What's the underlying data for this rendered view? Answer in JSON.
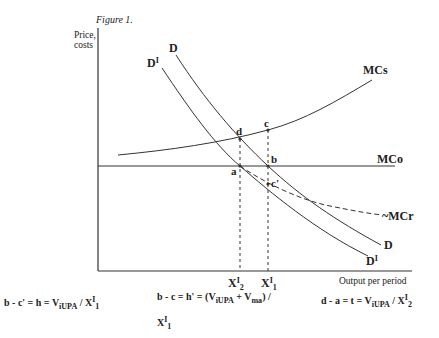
{
  "figure": {
    "title": "Figure 1.",
    "y_axis_label_line1": "Price,",
    "y_axis_label_line2": "costs",
    "x_axis_label": "Output per period"
  },
  "curves": {
    "D_top": "D",
    "DI_top_base": "D",
    "DI_top_sup": "I",
    "MCs": "MCs",
    "MCo": "MCo",
    "MCr": "~MCr",
    "D_bottom": "D",
    "DI_bottom_base": "D",
    "DI_bottom_sup": "I"
  },
  "points": {
    "a": "a",
    "b": "b",
    "c": "c",
    "c_prime": "c'",
    "d": "d"
  },
  "x_ticks": {
    "x2_base": "X",
    "x2_sup": "I",
    "x2_sub": "2",
    "x1_base": "X",
    "x1_sup": "I",
    "x1_sub": "1"
  },
  "formulas": {
    "f1_prefix": "b - c' = h = V",
    "f1_sub": "iUPA",
    "f1_mid": " / X",
    "f1_sup": "I",
    "f1_sub2": "1",
    "f2_prefix": "b - c  = h' = (V",
    "f2_sub": "iUPA",
    "f2_mid": " + V",
    "f2_sub2": "ma",
    "f2_end": ") /",
    "f2_line2_base": "X",
    "f2_line2_sup": "I",
    "f2_line2_sub": "1",
    "f3_prefix": "d - a = t = V",
    "f3_sub": "iUPA",
    "f3_mid": " / X",
    "f3_sup": "I",
    "f3_sub2": "2"
  }
}
